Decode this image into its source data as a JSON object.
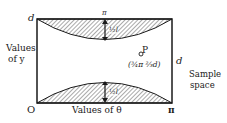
{
  "diagram": {
    "axes": {
      "y_top_label": "d",
      "y_axis_label_line1": "Values",
      "y_axis_label_line2": "of y",
      "origin_label": "O",
      "x_axis_label": "Values of θ",
      "x_right_label": "π",
      "top_center_label": "π",
      "right_side_label": "d"
    },
    "regions": [
      {
        "name": "upper-shaded",
        "arrow_label": "½l"
      },
      {
        "name": "lower-shaded",
        "arrow_label": "½l"
      }
    ],
    "point": {
      "label": "P",
      "coords": "(¾π  ⅔d)"
    },
    "sample_space_line1": "Sample",
    "sample_space_line2": "space",
    "colors": {
      "line": "#1a1a1a",
      "hatch": "#555555",
      "background": "#ffffff"
    }
  }
}
